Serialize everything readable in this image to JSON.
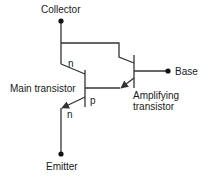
{
  "diagram": {
    "labels": {
      "collector": "Collector",
      "base": "Base",
      "emitter": "Emitter",
      "main_transistor": "Main transistor",
      "amplifying_line1": "Amplifying",
      "amplifying_line2": "transistor",
      "main_collector_region": "n",
      "main_base_region": "p",
      "main_emitter_region": "n"
    },
    "colors": {
      "stroke": "#333333",
      "text": "#1a1a1a"
    }
  }
}
